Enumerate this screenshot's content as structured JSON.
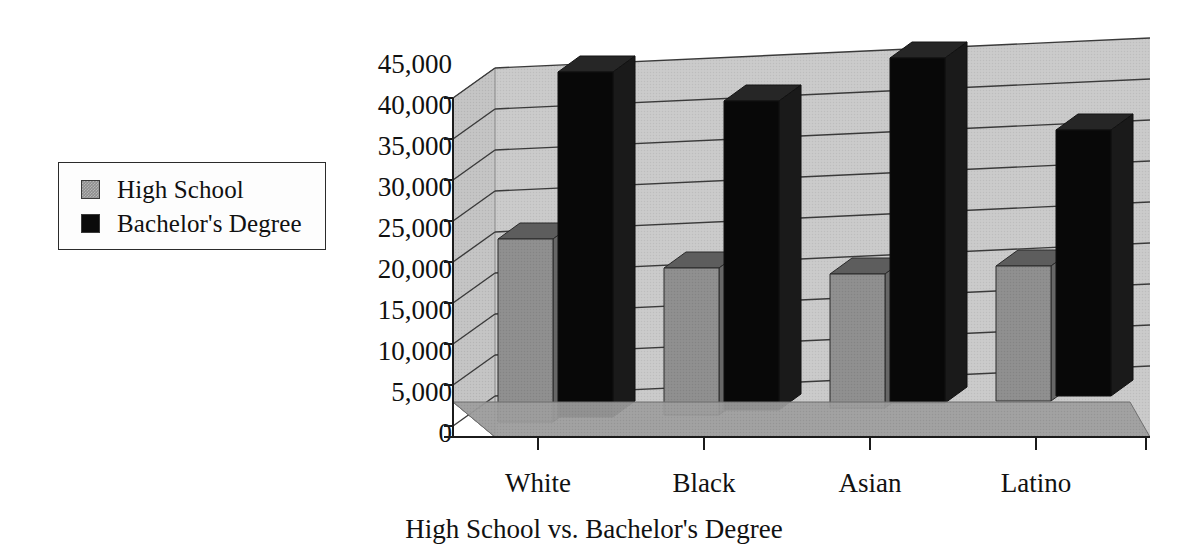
{
  "chart_data": {
    "type": "bar",
    "title": "High School vs. Bachelor's Degree",
    "xlabel": "",
    "ylabel": "",
    "ylim": [
      0,
      45000
    ],
    "ytick_values": [
      0,
      5000,
      10000,
      15000,
      20000,
      25000,
      30000,
      35000,
      40000,
      45000
    ],
    "ytick_labels": [
      "0",
      "5,000",
      "10,000",
      "15,000",
      "20,000",
      "25,000",
      "30,000",
      "35,000",
      "40,000",
      "45,000"
    ],
    "categories": [
      "White",
      "Black",
      "Asian",
      "Latino"
    ],
    "grid": true,
    "legend_position": "left-outside",
    "style": "3d-clustered-column",
    "series": [
      {
        "name": "High School",
        "color": "#8e8e8e",
        "values": [
          28000,
          23500,
          23000,
          23500
        ]
      },
      {
        "name": "Bachelor's Degree",
        "color": "#0b0b0b",
        "values": [
          43000,
          40000,
          43500,
          36500
        ]
      }
    ]
  },
  "legend": {
    "items": [
      {
        "label": "High School",
        "swatch": "gray-swatch"
      },
      {
        "label": "Bachelor's Degree",
        "swatch": "black-swatch"
      }
    ]
  },
  "axes": {
    "y_labels": [
      "45,000",
      "40,000",
      "35,000",
      "30,000",
      "25,000",
      "20,000",
      "15,000",
      "10,000",
      "5,000",
      "0"
    ],
    "x_labels": [
      "White",
      "Black",
      "Asian",
      "Latino"
    ]
  },
  "caption": "High School vs. Bachelor's Degree",
  "colors": {
    "wall": "#c9c9c9",
    "floor": "#9a9a9a",
    "gridline": "#2f2f2f",
    "series_high_school": "#8e8e8e",
    "series_bachelors": "#0b0b0b",
    "text": "#111111",
    "background": "#ffffff"
  }
}
